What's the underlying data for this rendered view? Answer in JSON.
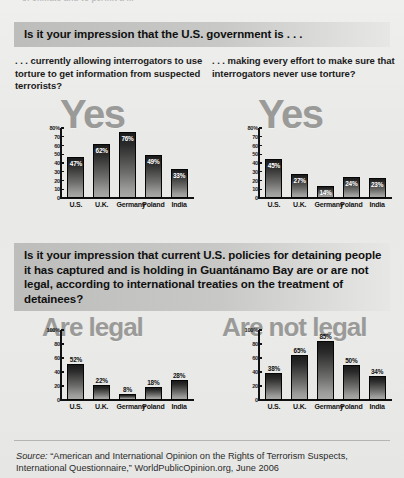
{
  "cutoff_text": "of climate and to permit a ...",
  "section1": {
    "banner": "Is it your impression that the U.S. government is . . .",
    "subquestion_left": ". . . currently allowing interrogators to use torture to get information from suspected terrorists?",
    "subquestion_right": ". . . making every effort to make sure that interrogators never use torture?",
    "watermark_left": "Yes",
    "watermark_right": "Yes"
  },
  "section2": {
    "banner": "Is it your impression that current U.S. policies for detaining people it has captured and is holding in Guantánamo Bay are or are not legal, according to international treaties on the treatment of detainees?",
    "watermark_left": "Are legal",
    "watermark_right": "Are not legal"
  },
  "footer": {
    "source_prefix": "Source:",
    "source_text": "“American and International Opinion on the Rights of Terrorism Suspects, International Questionnaire,” WorldPublicOpinion.org, June 2006"
  },
  "colors": {
    "banner_start": "#bdbdbb",
    "banner_end": "#e7e7e5",
    "watermark": "#9a9a98",
    "bar_top": "#1b1b1b",
    "bar_bottom": "#a8a8a6",
    "page_bg": "#e9e9e7"
  },
  "chart_data": [
    {
      "id": "chart1",
      "type": "bar",
      "title": "Yes",
      "xlabel": "",
      "ylabel": "",
      "ylim": [
        0,
        80
      ],
      "yticks": [
        "80%",
        "70",
        "60",
        "50",
        "40",
        "30",
        "20",
        "10",
        "0"
      ],
      "ytick_values": [
        80,
        70,
        60,
        50,
        40,
        30,
        20,
        10,
        0
      ],
      "grid": false,
      "label_position": "inside",
      "categories": [
        "U.S.",
        "U.K.",
        "Germany",
        "Poland",
        "India"
      ],
      "values": [
        47,
        62,
        76,
        49,
        33
      ],
      "value_labels": [
        "47%",
        "62%",
        "76%",
        "49%",
        "33%"
      ]
    },
    {
      "id": "chart2",
      "type": "bar",
      "title": "Yes",
      "xlabel": "",
      "ylabel": "",
      "ylim": [
        0,
        80
      ],
      "yticks": [
        "80%",
        "70",
        "60",
        "50",
        "40",
        "30",
        "20",
        "10",
        "0"
      ],
      "ytick_values": [
        80,
        70,
        60,
        50,
        40,
        30,
        20,
        10,
        0
      ],
      "grid": false,
      "label_position": "inside",
      "categories": [
        "U.S.",
        "U.K.",
        "Germany",
        "Poland",
        "India"
      ],
      "values": [
        45,
        27,
        14,
        24,
        23
      ],
      "value_labels": [
        "45%",
        "27%",
        "14%",
        "24%",
        "23%"
      ]
    },
    {
      "id": "chart3",
      "type": "bar",
      "title": "Are legal",
      "xlabel": "",
      "ylabel": "",
      "ylim": [
        0,
        100
      ],
      "yticks": [
        "100%",
        "80",
        "60",
        "40",
        "20",
        "0"
      ],
      "ytick_values": [
        100,
        80,
        60,
        40,
        20,
        0
      ],
      "grid": false,
      "label_position": "above",
      "categories": [
        "U.S.",
        "U.K.",
        "Germany",
        "Poland",
        "India"
      ],
      "values": [
        52,
        22,
        8,
        18,
        28
      ],
      "value_labels": [
        "52%",
        "22%",
        "8%",
        "18%",
        "28%"
      ]
    },
    {
      "id": "chart4",
      "type": "bar",
      "title": "Are not legal",
      "xlabel": "",
      "ylabel": "",
      "ylim": [
        0,
        100
      ],
      "yticks": [
        "100%",
        "80",
        "60",
        "40",
        "20",
        "0"
      ],
      "ytick_values": [
        100,
        80,
        60,
        40,
        20,
        0
      ],
      "grid": false,
      "label_position": "above",
      "categories": [
        "U.S.",
        "U.K.",
        "Germany",
        "Poland",
        "India"
      ],
      "values": [
        38,
        65,
        85,
        50,
        34
      ],
      "value_labels": [
        "38%",
        "65%",
        "85%",
        "50%",
        "34%"
      ]
    }
  ]
}
